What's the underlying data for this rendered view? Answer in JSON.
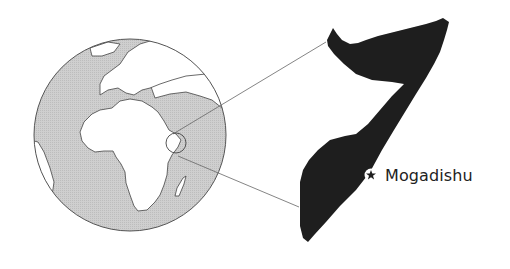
{
  "figure": {
    "globe": {
      "ocean_color": "#c9c9c9",
      "land_color": "#ffffff",
      "outline_color": "#555555"
    },
    "highlight_circle": {
      "label": "Somalia region on globe"
    },
    "inset": {
      "country_fill": "#1e1e1e",
      "country": "Somalia"
    },
    "capital": {
      "name": "Mogadishu",
      "marker": "star-icon"
    }
  }
}
